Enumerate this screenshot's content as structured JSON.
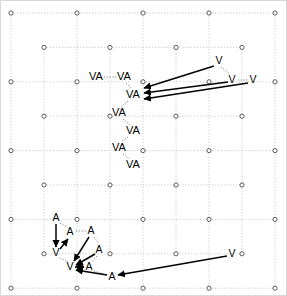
{
  "figure": {
    "width": 287,
    "height": 296,
    "background_color": "#ffffff",
    "border_color": "#bdbdbd"
  },
  "chart_data": {
    "type": "scatter",
    "title": "",
    "xlabel": "",
    "ylabel": "",
    "xlim": [
      0,
      287
    ],
    "ylim": [
      0,
      296
    ],
    "grid": true,
    "legend": null,
    "lattice": {
      "description": "triangular lattice of open circles, dotted connecting edges",
      "node_marker": "open-circle",
      "node_radius": 2.1,
      "row_spacing_px": 34.4,
      "column_spacing_px": 66,
      "row_x_offsets_px": [
        11,
        44
      ],
      "first_row_y_px": 13,
      "rows": 9,
      "cols_even": 5,
      "cols_odd": 4
    },
    "labels": [
      {
        "id": "va1",
        "text": "VA",
        "x": 96,
        "y": 77
      },
      {
        "id": "va2",
        "text": "VA",
        "x": 124,
        "y": 77
      },
      {
        "id": "va3",
        "text": "VA",
        "x": 133,
        "y": 95
      },
      {
        "id": "va4",
        "text": "VA",
        "x": 119,
        "y": 113
      },
      {
        "id": "va5",
        "text": "VA",
        "x": 133,
        "y": 131
      },
      {
        "id": "va6",
        "text": "VA",
        "x": 119,
        "y": 148
      },
      {
        "id": "va7",
        "text": "VA",
        "x": 133,
        "y": 165
      },
      {
        "id": "v1",
        "text": "V",
        "x": 219,
        "y": 61
      },
      {
        "id": "v2",
        "text": "V",
        "x": 232,
        "y": 80
      },
      {
        "id": "v3",
        "text": "V",
        "x": 253,
        "y": 80
      },
      {
        "id": "a1",
        "text": "A",
        "x": 56,
        "y": 218
      },
      {
        "id": "a2",
        "text": "A",
        "x": 70,
        "y": 232
      },
      {
        "id": "a3",
        "text": "A",
        "x": 91,
        "y": 231
      },
      {
        "id": "v4",
        "text": "V",
        "x": 56,
        "y": 253
      },
      {
        "id": "a4",
        "text": "A",
        "x": 99,
        "y": 250
      },
      {
        "id": "v5",
        "text": "V",
        "x": 70,
        "y": 267
      },
      {
        "id": "a5",
        "text": "A",
        "x": 89,
        "y": 267
      },
      {
        "id": "a6",
        "text": "A",
        "x": 112,
        "y": 277
      },
      {
        "id": "v6",
        "text": "V",
        "x": 232,
        "y": 254
      }
    ],
    "arrows": [
      {
        "id": "arrow-v1-to-va3",
        "x1": 214,
        "y1": 66,
        "x2": 144,
        "y2": 88
      },
      {
        "id": "arrow-v2-to-va3",
        "x1": 228,
        "y1": 82,
        "x2": 144,
        "y2": 93
      },
      {
        "id": "arrow-v3-to-va3",
        "x1": 248,
        "y1": 83,
        "x2": 144,
        "y2": 99
      },
      {
        "id": "arrow-a1-to-v4",
        "x1": 56,
        "y1": 224,
        "x2": 56,
        "y2": 247
      },
      {
        "id": "arrow-v4d-to-a2",
        "x1": 60,
        "y1": 249,
        "x2": 68,
        "y2": 239
      },
      {
        "id": "arrow-a3-to-v5",
        "x1": 89,
        "y1": 237,
        "x2": 74,
        "y2": 261
      },
      {
        "id": "arrow-a4-to-v5",
        "x1": 95,
        "y1": 254,
        "x2": 76,
        "y2": 265
      },
      {
        "id": "arrow-a5-to-v5",
        "x1": 84,
        "y1": 267,
        "x2": 76,
        "y2": 267
      },
      {
        "id": "arrow-v5-to-a5",
        "x1": 75,
        "y1": 267,
        "x2": 84,
        "y2": 267
      },
      {
        "id": "arrow-a6-to-v5",
        "x1": 107,
        "y1": 275,
        "x2": 76,
        "y2": 270
      },
      {
        "id": "arrow-v6-to-a6",
        "x1": 227,
        "y1": 256,
        "x2": 118,
        "y2": 275
      }
    ],
    "dotted_links": [
      {
        "id": "link-va1-va2",
        "x1": 104,
        "y1": 77,
        "x2": 117,
        "y2": 77
      },
      {
        "id": "link-va2-va3",
        "x1": 126,
        "y1": 83,
        "x2": 132,
        "y2": 89
      },
      {
        "id": "link-va3-va4",
        "x1": 128,
        "y1": 101,
        "x2": 121,
        "y2": 107
      },
      {
        "id": "link-va4-va5",
        "x1": 123,
        "y1": 119,
        "x2": 130,
        "y2": 125
      },
      {
        "id": "link-va5-va6",
        "x1": 128,
        "y1": 137,
        "x2": 121,
        "y2": 142
      },
      {
        "id": "link-va6-va7",
        "x1": 123,
        "y1": 154,
        "x2": 130,
        "y2": 159
      },
      {
        "id": "link-v1-v2",
        "x1": 221,
        "y1": 67,
        "x2": 230,
        "y2": 74
      },
      {
        "id": "link-v2-v3",
        "x1": 238,
        "y1": 80,
        "x2": 248,
        "y2": 80
      },
      {
        "id": "link-a1-a2",
        "x1": 60,
        "y1": 223,
        "x2": 67,
        "y2": 227
      },
      {
        "id": "link-a2-a3",
        "x1": 76,
        "y1": 231,
        "x2": 86,
        "y2": 231
      },
      {
        "id": "link-a3-a4",
        "x1": 94,
        "y1": 237,
        "x2": 99,
        "y2": 244
      },
      {
        "id": "link-a4-a5",
        "x1": 97,
        "y1": 256,
        "x2": 92,
        "y2": 262
      },
      {
        "id": "link-a5-a6",
        "x1": 94,
        "y1": 271,
        "x2": 107,
        "y2": 275
      },
      {
        "id": "link-v4-v5",
        "x1": 60,
        "y1": 258,
        "x2": 68,
        "y2": 262
      }
    ]
  }
}
